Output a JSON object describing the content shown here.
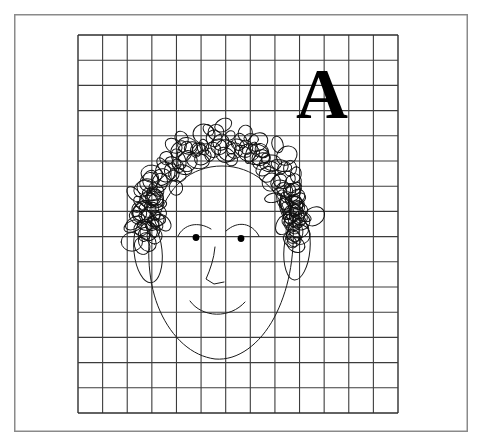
{
  "document": {
    "title": "Grid drawing worksheet",
    "background_color": "#ffffff",
    "canvas": {
      "width": 481,
      "height": 442
    }
  },
  "frame": {
    "name": "outer-page-border",
    "x": 14,
    "y": 14,
    "width": 454,
    "height": 418,
    "stroke_color": "#8a8a8a",
    "stroke_width": 1.5,
    "fill": "#ffffff"
  },
  "grid": {
    "name": "square-grid",
    "x": 78,
    "y": 35,
    "width": 320,
    "height": 378,
    "columns": 13,
    "rows": 15,
    "cell_width": 24.6,
    "cell_height": 25.2,
    "line_color": "#3c3c3c",
    "line_width": 1.1,
    "border_color": "#2e2e2e",
    "border_width": 1.4
  },
  "label": {
    "name": "letter-a-label",
    "text": "A",
    "x": 322,
    "y": 118,
    "font_size": 72,
    "font_weight": "bold",
    "color": "#000000"
  },
  "drawing": {
    "name": "hand-drawn-face",
    "stroke_color": "#1a1a1a",
    "stroke_width": 1.0,
    "parts": [
      {
        "name": "face-outline",
        "type": "path"
      },
      {
        "name": "hair-scribble",
        "type": "loops",
        "loop_count": 120
      },
      {
        "name": "left-ear",
        "type": "ellipse",
        "cx": 148,
        "cy": 251,
        "rx": 14,
        "ry": 32
      },
      {
        "name": "right-ear",
        "type": "ellipse",
        "cx": 297,
        "cy": 249,
        "rx": 13,
        "ry": 31
      },
      {
        "name": "left-eyebrow",
        "type": "arc"
      },
      {
        "name": "right-eyebrow",
        "type": "arc"
      },
      {
        "name": "left-eye",
        "type": "dot",
        "cx": 196,
        "cy": 237,
        "r": 3.4
      },
      {
        "name": "right-eye",
        "type": "dot",
        "cx": 241,
        "cy": 238,
        "r": 3.4
      },
      {
        "name": "nose",
        "type": "polyline"
      },
      {
        "name": "mouth",
        "type": "arc"
      }
    ]
  },
  "chart_data": {
    "type": "table",
    "categories": [
      "columns",
      "rows"
    ],
    "values": [
      13,
      15
    ],
    "xlabel": "",
    "ylabel": ""
  }
}
